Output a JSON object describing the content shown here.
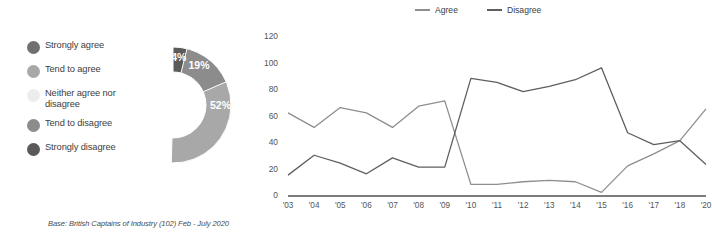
{
  "donut": {
    "title": "",
    "legend": [
      {
        "label": "Strongly agree",
        "color": "#707070",
        "value": 14
      },
      {
        "label": "Tend to agree",
        "color": "#a8a8a8",
        "value": 52
      },
      {
        "label": "Neither agree nor disagree",
        "color": "#ededed",
        "value": 14
      },
      {
        "label": "Tend to disagree",
        "color": "#8c8c8c",
        "value": 19
      },
      {
        "label": "Strongly disagree",
        "color": "#5a5a5a",
        "value": 4
      }
    ],
    "slice_labels": [
      "14%",
      "52%",
      "14%",
      "19%",
      "4%"
    ],
    "base_note": "Base: British Captains of Industry (102) Feb - July 2020"
  },
  "chart_data": {
    "type": "line",
    "title": "",
    "xlabel": "",
    "ylabel": "",
    "ylim": [
      0,
      120
    ],
    "yticks": [
      0,
      20,
      40,
      60,
      80,
      100,
      120
    ],
    "ytick_labels": [
      "0",
      "20",
      "40",
      "60",
      "80",
      "100",
      "120"
    ],
    "grid": false,
    "legend_position": "top",
    "categories": [
      "'03",
      "'04",
      "'05",
      "'06",
      "'07",
      "'08",
      "'09",
      "'10",
      "'11",
      "'12",
      "'13",
      "'14",
      "'15",
      "'16",
      "'17",
      "'18",
      "'20"
    ],
    "series": [
      {
        "name": "Agree",
        "color": "#8e8e8e",
        "values": [
          62,
          51,
          66,
          62,
          51,
          67,
          71,
          8,
          8,
          10,
          11,
          10,
          2,
          22,
          31,
          41,
          65
        ]
      },
      {
        "name": "Disagree",
        "color": "#5f5f5f",
        "values": [
          15,
          30,
          24,
          16,
          28,
          21,
          21,
          88,
          85,
          78,
          82,
          87,
          96,
          47,
          38,
          41,
          23
        ]
      }
    ]
  }
}
